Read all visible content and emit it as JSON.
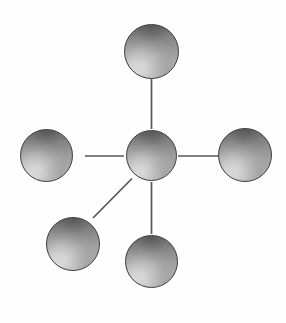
{
  "diagram": {
    "type": "node-link-graph",
    "topology": "star",
    "background_color": "#fefefe",
    "node_count": 6,
    "edge_count": 5,
    "node_style": {
      "shape": "sphere",
      "fill_kind": "vertical-linear-gradient",
      "gradient_top_color": "#6b6b6b",
      "gradient_mid_color": "#a8a8a8",
      "gradient_bottom_color": "#c9c9c9",
      "outline_color": "#3a3a3a",
      "outline_width_px": 1.3
    },
    "edge_style": {
      "stroke_color": "#55555a",
      "stroke_width_px": 1.7,
      "line_kind": "straight"
    },
    "nodes": [
      {
        "id": "hub",
        "role": "center",
        "label": "",
        "cx": 151,
        "cy": 155,
        "r": 25.5
      },
      {
        "id": "node-top",
        "role": "leaf",
        "label": "",
        "cx": 151,
        "cy": 51,
        "r": 27.5
      },
      {
        "id": "node-left",
        "role": "leaf",
        "label": "",
        "cx": 46,
        "cy": 155,
        "r": 26.5
      },
      {
        "id": "node-right",
        "role": "leaf",
        "label": "",
        "cx": 245,
        "cy": 155,
        "r": 27.0
      },
      {
        "id": "node-bottom",
        "role": "leaf",
        "label": "",
        "cx": 151,
        "cy": 261,
        "r": 26.5
      },
      {
        "id": "node-bottom-left",
        "role": "leaf",
        "label": "",
        "cx": 73,
        "cy": 244,
        "r": 27.0
      }
    ],
    "edges": [
      {
        "id": "edge-hub-top",
        "from": "hub",
        "to": "node-top",
        "x1": 151.5,
        "y1": 129.0,
        "x2": 151.5,
        "y2": 79.0
      },
      {
        "id": "edge-hub-left",
        "from": "hub",
        "to": "node-left",
        "x1": 124.0,
        "y1": 156.0,
        "x2": 85.0,
        "y2": 156.0
      },
      {
        "id": "edge-hub-right",
        "from": "hub",
        "to": "node-right",
        "x1": 178.0,
        "y1": 156.0,
        "x2": 218.0,
        "y2": 156.0
      },
      {
        "id": "edge-hub-bottom",
        "from": "hub",
        "to": "node-bottom",
        "x1": 151.5,
        "y1": 182.0,
        "x2": 151.5,
        "y2": 234.0
      },
      {
        "id": "edge-hub-bottom-left",
        "from": "hub",
        "to": "node-bottom-left",
        "x1": 132.0,
        "y1": 178.5,
        "x2": 93.0,
        "y2": 218.0
      }
    ]
  }
}
